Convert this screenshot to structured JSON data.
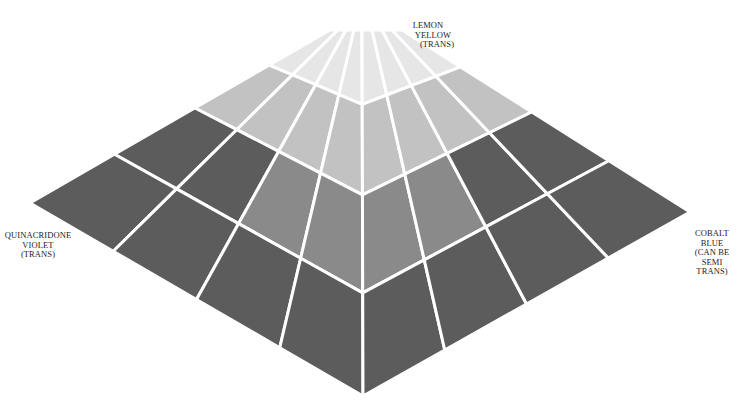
{
  "diagram": {
    "grid": {
      "rows": 4,
      "cols_left": 4,
      "cols_right": 4
    },
    "corners": {
      "top_left": [
        330,
        30
      ],
      "top_right": [
        402,
        30
      ],
      "left": [
        30,
        203
      ],
      "right": [
        690,
        212
      ],
      "bottom": [
        363,
        396
      ],
      "apex": [
        362,
        30
      ]
    },
    "colors": {
      "paper": "#ffffff",
      "gap": "#ffffff",
      "light": "#e6e6e6",
      "mid_light": "#c2c2c2",
      "mid": "#8a8a8a",
      "dark": "#5c5c5c",
      "darkest": "#535353"
    }
  },
  "labels": {
    "top": [
      "LEMON",
      "YELLOW",
      "(TRANS)"
    ],
    "left": [
      "QUINACRIDONE",
      "VIOLET",
      "(TRANS)"
    ],
    "right": [
      "COBALT",
      "BLUE",
      "(CAN BE",
      "SEMI",
      "TRANS)"
    ]
  }
}
